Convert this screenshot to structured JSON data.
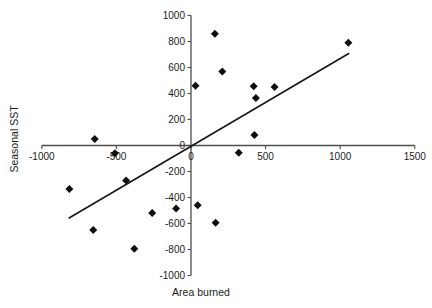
{
  "chart_data": {
    "type": "scatter",
    "title": "",
    "xlabel": "Area burned",
    "ylabel": "Seasonal SST",
    "xlim": [
      -1000,
      1500
    ],
    "ylim": [
      -1000,
      1000
    ],
    "x_ticks": [
      -1000,
      -500,
      0,
      500,
      1000,
      1500
    ],
    "y_ticks": [
      1000,
      800,
      600,
      400,
      200,
      0,
      -200,
      -400,
      -600,
      -800,
      -1000
    ],
    "grid": false,
    "legend": null,
    "marker": "diamond",
    "marker_color": "#0e0e0e",
    "axis_color": "#4d4d4d",
    "text_color": "#1c1c1c",
    "trendline_color": "#161616",
    "points": [
      [
        -815,
        -335
      ],
      [
        -655,
        -650
      ],
      [
        -645,
        50
      ],
      [
        -510,
        -60
      ],
      [
        -435,
        -270
      ],
      [
        -380,
        -795
      ],
      [
        -260,
        -520
      ],
      [
        -100,
        -485
      ],
      [
        30,
        460
      ],
      [
        45,
        -460
      ],
      [
        160,
        860
      ],
      [
        165,
        -595
      ],
      [
        210,
        570
      ],
      [
        320,
        -55
      ],
      [
        425,
        80
      ],
      [
        420,
        455
      ],
      [
        435,
        365
      ],
      [
        560,
        450
      ],
      [
        1055,
        790
      ]
    ],
    "trendline": {
      "x1": -820,
      "y1": -560,
      "x2": 1060,
      "y2": 710
    }
  }
}
